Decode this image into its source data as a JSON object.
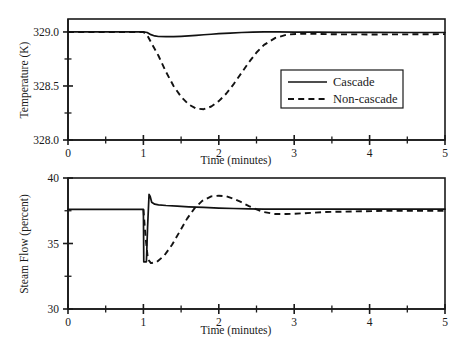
{
  "figure": {
    "title": "",
    "background": "#ffffff",
    "ink_color": "#121212"
  },
  "legend": {
    "position": "inside-top-plot-right-center",
    "entries": [
      {
        "label": "Cascade",
        "style": "solid"
      },
      {
        "label": "Non-cascade",
        "style": "dashed"
      }
    ]
  },
  "chart_data": [
    {
      "type": "line",
      "id": "temperature-panel",
      "title": "",
      "xlabel": "Time (minutes)",
      "ylabel": "Temperature (K)",
      "xlim": [
        0,
        5
      ],
      "ylim": [
        328.0,
        329.12
      ],
      "xticks": [
        0,
        1,
        2,
        3,
        4,
        5
      ],
      "xticklabels": [
        "0",
        "1",
        "2",
        "3",
        "4",
        "5"
      ],
      "xminorticks": [
        0.5,
        1.5,
        2.5,
        3.5,
        4.5
      ],
      "yticks": [
        328.0,
        328.5,
        329.0
      ],
      "yticklabels": [
        "328.0",
        "328.5",
        "329.0"
      ],
      "yminorticks": [
        328.25,
        328.75
      ],
      "grid": false,
      "series": [
        {
          "name": "Cascade",
          "style": "solid",
          "x": [
            0,
            0.25,
            0.5,
            0.75,
            1.0,
            1.05,
            1.1,
            1.15,
            1.2,
            1.3,
            1.4,
            1.5,
            1.6,
            1.7,
            1.8,
            1.9,
            2.0,
            2.15,
            2.3,
            2.45,
            2.6,
            2.8,
            3.0,
            3.3,
            3.6,
            4.0,
            4.5,
            5.0
          ],
          "y": [
            329.0,
            329.0,
            329.0,
            329.0,
            329.0,
            328.995,
            328.975,
            328.963,
            328.958,
            328.956,
            328.957,
            328.96,
            328.964,
            328.969,
            328.974,
            328.979,
            328.984,
            328.99,
            328.995,
            328.998,
            329.0,
            329.0,
            328.999,
            328.998,
            328.997,
            328.996,
            328.995,
            328.995
          ]
        },
        {
          "name": "Non-cascade",
          "style": "dashed",
          "x": [
            0,
            0.25,
            0.5,
            0.75,
            1.0,
            1.05,
            1.12,
            1.2,
            1.3,
            1.4,
            1.5,
            1.6,
            1.7,
            1.8,
            1.9,
            2.0,
            2.1,
            2.2,
            2.3,
            2.4,
            2.5,
            2.6,
            2.75,
            2.9,
            3.1,
            3.3,
            3.6,
            4.0,
            4.5,
            5.0
          ],
          "y": [
            329.0,
            329.0,
            329.0,
            329.0,
            329.0,
            328.97,
            328.88,
            328.78,
            328.63,
            328.5,
            328.4,
            328.33,
            328.29,
            328.285,
            328.31,
            328.36,
            328.43,
            328.52,
            328.62,
            328.72,
            328.81,
            328.88,
            328.945,
            328.975,
            328.985,
            328.982,
            328.978,
            328.977,
            328.978,
            328.98
          ]
        }
      ]
    },
    {
      "type": "line",
      "id": "steam-flow-panel",
      "title": "",
      "xlabel": "Time (minutes)",
      "ylabel": "Steam Flow (percent)",
      "xlim": [
        0,
        5
      ],
      "ylim": [
        30,
        40
      ],
      "xticks": [
        0,
        1,
        2,
        3,
        4,
        5
      ],
      "xticklabels": [
        "0",
        "1",
        "2",
        "3",
        "4",
        "5"
      ],
      "xminorticks": [
        0.5,
        1.5,
        2.5,
        3.5,
        4.5
      ],
      "yticks": [
        30,
        35,
        40
      ],
      "yticklabels": [
        "30",
        "35",
        "40"
      ],
      "yminorticks": [
        32.5,
        37.5
      ],
      "grid": false,
      "series": [
        {
          "name": "Cascade",
          "style": "solid",
          "x": [
            0,
            0.3,
            0.6,
            0.9,
            1.0,
            1.005,
            1.04,
            1.055,
            1.075,
            1.09,
            1.11,
            1.15,
            1.2,
            1.3,
            1.45,
            1.6,
            1.8,
            2.0,
            2.2,
            2.4,
            2.6,
            2.9,
            3.2,
            3.6,
            4.1,
            4.6,
            5.0
          ],
          "y": [
            37.6,
            37.6,
            37.6,
            37.6,
            37.6,
            33.6,
            33.6,
            36.2,
            38.75,
            38.6,
            38.15,
            38.0,
            37.95,
            37.9,
            37.85,
            37.8,
            37.75,
            37.7,
            37.67,
            37.65,
            37.63,
            37.62,
            37.62,
            37.62,
            37.62,
            37.62,
            37.62
          ]
        },
        {
          "name": "Non-cascade",
          "style": "dashed",
          "x": [
            1.0,
            1.03,
            1.06,
            1.1,
            1.18,
            1.28,
            1.38,
            1.48,
            1.58,
            1.68,
            1.78,
            1.9,
            2.0,
            2.1,
            2.2,
            2.3,
            2.4,
            2.5,
            2.6,
            2.75,
            2.9,
            3.1,
            3.4,
            3.8,
            4.3,
            5.0
          ],
          "y": [
            37.6,
            35.4,
            33.8,
            33.5,
            33.6,
            34.1,
            34.9,
            35.9,
            36.9,
            37.7,
            38.25,
            38.6,
            38.65,
            38.6,
            38.4,
            38.15,
            37.85,
            37.6,
            37.4,
            37.25,
            37.25,
            37.3,
            37.4,
            37.45,
            37.5,
            37.5
          ]
        }
      ]
    }
  ]
}
